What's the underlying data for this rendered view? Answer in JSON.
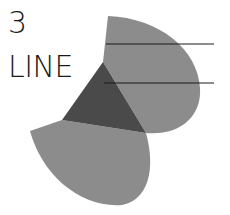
{
  "figure": {
    "number_label": "3",
    "title_label": "LINE",
    "colors": {
      "light_sector": "#8c8c8c",
      "dark_triangle": "#4a4a4a",
      "line": "#1a1a1a",
      "text": "#1a1a1a",
      "background": "#ffffff"
    },
    "shapes": [
      {
        "name": "upper-sector",
        "type": "sector",
        "shade": "light"
      },
      {
        "name": "lower-sector",
        "type": "sector",
        "shade": "light"
      },
      {
        "name": "center-triangle",
        "type": "triangle",
        "shade": "dark"
      }
    ],
    "lines": [
      {
        "name": "upper-line",
        "count": 1
      },
      {
        "name": "lower-line",
        "count": 1
      }
    ]
  }
}
